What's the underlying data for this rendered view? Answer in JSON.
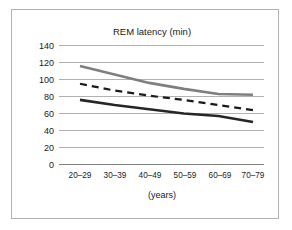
{
  "figure": {
    "border_color": "#b2b2b2",
    "background": "#ffffff"
  },
  "chart_data": {
    "type": "line",
    "title": "REM latency (min)",
    "xlabel": "(years)",
    "ylabel": "",
    "categories": [
      "20–29",
      "30–39",
      "40–49",
      "50–59",
      "60–69",
      "70–79"
    ],
    "ytick_labels": [
      "0",
      "20",
      "40",
      "60",
      "80",
      "100",
      "120",
      "140"
    ],
    "ytick_values": [
      0,
      20,
      40,
      60,
      80,
      100,
      120,
      140
    ],
    "ylim": [
      0,
      140
    ],
    "grid": "horizontal",
    "legend": "none",
    "series": [
      {
        "name": "upper",
        "style": "solid",
        "color": "#7f7f7f",
        "width": 2.6,
        "values": [
          116,
          106,
          96,
          89,
          83,
          82
        ]
      },
      {
        "name": "middle",
        "style": "dashed",
        "color": "#1a1a1a",
        "width": 2.2,
        "values": [
          95,
          87,
          81,
          76,
          70,
          64
        ]
      },
      {
        "name": "lower",
        "style": "solid",
        "color": "#262626",
        "width": 2.6,
        "values": [
          76,
          70,
          65,
          60,
          57,
          50
        ]
      }
    ]
  }
}
